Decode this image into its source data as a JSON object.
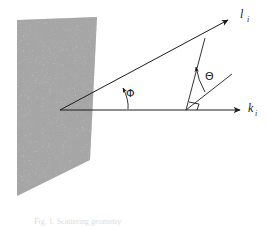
{
  "figure": {
    "background_color": "#ffffff",
    "ink_color": "#1c1c1c",
    "plane": {
      "name": "stippled-plane",
      "fill_color": "#9a9a9a",
      "texture": "stipple-noise",
      "corners": [
        [
          17,
          20
        ],
        [
          97,
          17
        ],
        [
          90,
          160
        ],
        [
          17,
          196
        ]
      ]
    },
    "origin": [
      60,
      110
    ],
    "rays": [
      {
        "id": "k-ray",
        "label": "k",
        "subscript": "i",
        "from": [
          60,
          110
        ],
        "to": [
          245,
          110
        ],
        "label_pos": [
          249,
          113
        ]
      },
      {
        "id": "l-ray",
        "label": "l",
        "subscript": "i",
        "from": [
          60,
          110
        ],
        "to": [
          232,
          18
        ],
        "label_pos": [
          240,
          18
        ]
      }
    ],
    "angles": [
      {
        "id": "phi-angle",
        "symbol": "Φ",
        "label_pos": [
          131,
          94
        ],
        "between": [
          "k-ray",
          "l-ray"
        ]
      },
      {
        "id": "theta-angle",
        "symbol": "Θ",
        "label_pos": [
          209,
          76
        ],
        "between": [
          "scatter-normal",
          "scatter-ray"
        ]
      }
    ],
    "normal_line": {
      "id": "scatter-normal",
      "from": [
        205,
        38
      ],
      "to": [
        186,
        110
      ]
    },
    "scatter_line": {
      "id": "scatter-ray",
      "from": [
        186,
        110
      ],
      "to": [
        228,
        78
      ]
    },
    "right_angle_marker": {
      "id": "right-angle-marker",
      "vertex": [
        190,
        110
      ]
    },
    "caption": "Fig. 1.   Scattering geometry"
  }
}
